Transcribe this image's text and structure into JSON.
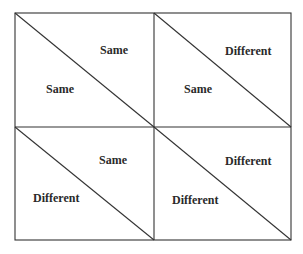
{
  "diagram": {
    "cells": [
      {
        "position": "top-left",
        "upper_right_label": "Same",
        "lower_left_label": "Same"
      },
      {
        "position": "top-right",
        "upper_right_label": "Different",
        "lower_left_label": "Same"
      },
      {
        "position": "bottom-left",
        "upper_right_label": "Same",
        "lower_left_label": "Different"
      },
      {
        "position": "bottom-right",
        "upper_right_label": "Different",
        "lower_left_label": "Different"
      }
    ]
  }
}
